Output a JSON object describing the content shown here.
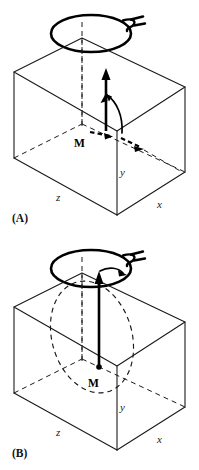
{
  "figure": {
    "background_color": "#ffffff",
    "line_color": "#1a1a1a",
    "accent_color": "#000000",
    "width_px": 199,
    "height_px": 470
  },
  "panels": [
    {
      "id": "A",
      "label": "(A)",
      "caption": "Magnetization M tipped from equilibrium with transverse component",
      "coil": {
        "name": "rf-coil",
        "shape": "ellipse",
        "lead_wire": "twisted-pair-lead"
      },
      "magnetization": {
        "symbol": "M",
        "vector_label": "M",
        "direction": "vertical-up",
        "has_tip_arrow": true,
        "has_precession_arc": true,
        "has_transverse_dashed_arrow": true
      },
      "axes": [
        {
          "name": "y-axis",
          "label": "y",
          "direction": "vertical"
        },
        {
          "name": "z-axis",
          "label": "z",
          "direction": "left-depth"
        },
        {
          "name": "x-axis",
          "label": "x",
          "direction": "right-depth"
        }
      ]
    },
    {
      "id": "B",
      "label": "(B)",
      "caption": "Magnetization M precessing on a cone about the static field",
      "coil": {
        "name": "rf-coil",
        "shape": "ellipse",
        "lead_wire": "twisted-pair-lead"
      },
      "magnetization": {
        "symbol": "M",
        "vector_label": "M",
        "direction": "vertical-up",
        "has_tip_arrow": true,
        "has_precession_ellipse": true,
        "has_origin_dot": true
      },
      "axes": [
        {
          "name": "y-axis",
          "label": "y",
          "direction": "vertical"
        },
        {
          "name": "z-axis",
          "label": "z",
          "direction": "left-depth"
        },
        {
          "name": "x-axis",
          "label": "x",
          "direction": "right-depth"
        }
      ]
    }
  ]
}
